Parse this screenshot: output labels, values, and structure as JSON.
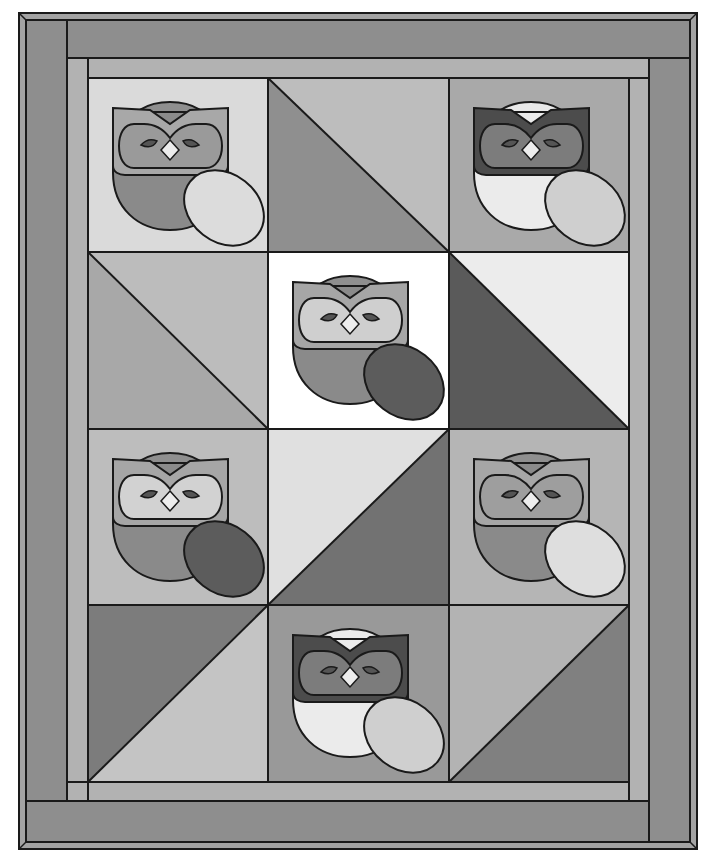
{
  "colors": {
    "stroke": "#1a1a1a",
    "binding": "#9c9c9c",
    "outer_border": "#8e8e8e",
    "inner_border": "#b2b2b2",
    "white": "#ffffff",
    "very_light": "#e6e6e6",
    "light": "#cfcfcf",
    "mid_light": "#b9b9b9",
    "mid": "#a3a3a3",
    "mid_dark": "#8a8a8a",
    "dark": "#727272",
    "darker": "#5e5e5e",
    "darkest": "#4a4a4a"
  },
  "grid": {
    "columns": 3,
    "rows": 4,
    "x": [
      88,
      268,
      449,
      629
    ],
    "y": [
      78,
      252,
      429,
      605,
      782
    ]
  },
  "blocks": [
    {
      "row": 0,
      "col": 0,
      "type": "owl",
      "bg": "#dadada",
      "head": "#8f8f8f",
      "face": "#a8a8a8",
      "mask": "#9a9a9a",
      "body": "#8a8a8a",
      "egg": "#dcdcdc",
      "beak": "#ececec",
      "eye": "#555555"
    },
    {
      "row": 0,
      "col": 1,
      "type": "hst",
      "split": "tl-br",
      "a": "#8f8f8f",
      "b": "#bdbdbd",
      "a_side": "bottom-left"
    },
    {
      "row": 0,
      "col": 2,
      "type": "owl",
      "bg": "#a9a9a9",
      "head": "#e8e8e8",
      "face": "#4c4c4c",
      "mask": "#7c7c7c",
      "body": "#ebebeb",
      "egg": "#cfcfcf",
      "beak": "#ededed",
      "eye": "#555555"
    },
    {
      "row": 1,
      "col": 0,
      "type": "hst",
      "split": "tl-br",
      "a": "#a8a8a8",
      "b": "#bcbcbc",
      "a_side": "bottom-left"
    },
    {
      "row": 1,
      "col": 1,
      "type": "owl",
      "bg": "#ffffff",
      "head": "#8f8f8f",
      "face": "#a6a6a6",
      "mask": "#cfcfcf",
      "body": "#8a8a8a",
      "egg": "#5c5c5c",
      "beak": "#ededed",
      "eye": "#555555"
    },
    {
      "row": 1,
      "col": 2,
      "type": "hst",
      "split": "tl-br",
      "a": "#5a5a5a",
      "b": "#ececec",
      "a_side": "bottom-left"
    },
    {
      "row": 2,
      "col": 0,
      "type": "owl",
      "bg": "#bdbdbd",
      "head": "#8f8f8f",
      "face": "#a6a6a6",
      "mask": "#d2d2d2",
      "body": "#8a8a8a",
      "egg": "#5c5c5c",
      "beak": "#ededed",
      "eye": "#555555"
    },
    {
      "row": 2,
      "col": 1,
      "type": "hst",
      "split": "bl-tr",
      "a": "#e0e0e0",
      "b": "#727272",
      "a_side": "top-left"
    },
    {
      "row": 2,
      "col": 2,
      "type": "owl",
      "bg": "#b5b5b5",
      "head": "#8f8f8f",
      "face": "#a6a6a6",
      "mask": "#9e9e9e",
      "body": "#8a8a8a",
      "egg": "#dedede",
      "beak": "#ededed",
      "eye": "#555555"
    },
    {
      "row": 3,
      "col": 0,
      "type": "hst",
      "split": "bl-tr",
      "a": "#7c7c7c",
      "b": "#c4c4c4",
      "a_side": "top-left"
    },
    {
      "row": 3,
      "col": 1,
      "type": "owl",
      "bg": "#999999",
      "head": "#eaeaea",
      "face": "#4c4c4c",
      "mask": "#7c7c7c",
      "body": "#ebebeb",
      "egg": "#cfcfcf",
      "beak": "#ededed",
      "eye": "#555555"
    },
    {
      "row": 3,
      "col": 2,
      "type": "hst",
      "split": "bl-tr",
      "a": "#b3b3b3",
      "b": "#808080",
      "a_side": "top-left"
    }
  ]
}
